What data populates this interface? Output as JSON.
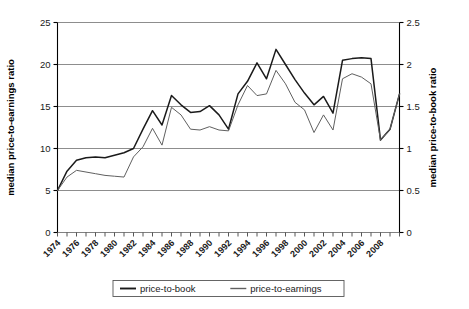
{
  "chart_data": {
    "type": "line",
    "title": "",
    "xlabel": "",
    "ylabel": "median price-to-earnings ratio",
    "y2label": "median price-to-book ratio",
    "grid": true,
    "legend_position": "bottom",
    "xlim": [
      1974,
      2010
    ],
    "ylim": [
      0,
      25
    ],
    "y2lim": [
      0,
      2.5
    ],
    "yticks": [
      "0",
      "5",
      "10",
      "15",
      "20",
      "25"
    ],
    "ytick_values": [
      0,
      5,
      10,
      15,
      20,
      25
    ],
    "y2ticks": [
      "0",
      "0.5",
      "1",
      "1.5",
      "2",
      "2.5"
    ],
    "y2tick_values": [
      0,
      0.5,
      1,
      1.5,
      2,
      2.5
    ],
    "x": [
      1974,
      1975,
      1976,
      1977,
      1978,
      1979,
      1980,
      1981,
      1982,
      1983,
      1984,
      1985,
      1986,
      1987,
      1988,
      1989,
      1990,
      1991,
      1992,
      1993,
      1994,
      1995,
      1996,
      1997,
      1998,
      1999,
      2000,
      2001,
      2002,
      2003,
      2004,
      2005,
      2006,
      2007,
      2008,
      2009,
      2010
    ],
    "xticklabels": [
      "1974",
      "1976",
      "1978",
      "1980",
      "1982",
      "1984",
      "1986",
      "1988",
      "1990",
      "1992",
      "1994",
      "1996",
      "1998",
      "2000",
      "2002",
      "2004",
      "2006",
      "2008"
    ],
    "xticklabel_values": [
      1974,
      1976,
      1978,
      1980,
      1982,
      1984,
      1986,
      1988,
      1990,
      1992,
      1994,
      1996,
      1998,
      2000,
      2002,
      2004,
      2006,
      2008
    ],
    "series": [
      {
        "name": "price-to-book",
        "axis": "right",
        "color": "#1a1a1a",
        "width": 1.5,
        "values_left_scale": [
          5.0,
          7.3,
          8.6,
          8.9,
          9.0,
          8.9,
          9.2,
          9.5,
          10.0,
          12.3,
          14.5,
          12.8,
          16.3,
          15.2,
          14.3,
          14.4,
          15.1,
          14.0,
          12.3,
          16.5,
          18.0,
          20.2,
          18.3,
          21.8,
          20.0,
          18.2,
          16.6,
          15.2,
          16.2,
          14.2,
          20.5,
          20.7,
          20.8,
          20.7,
          11.0,
          12.3,
          16.5
        ],
        "values": [
          0.5,
          0.73,
          0.86,
          0.89,
          0.9,
          0.89,
          0.92,
          0.95,
          1.0,
          1.23,
          1.45,
          1.28,
          1.63,
          1.52,
          1.43,
          1.44,
          1.51,
          1.4,
          1.23,
          1.65,
          1.8,
          2.02,
          1.83,
          2.18,
          2.0,
          1.82,
          1.66,
          1.52,
          1.62,
          1.42,
          2.05,
          2.07,
          2.08,
          2.07,
          1.1,
          1.23,
          1.65
        ]
      },
      {
        "name": "price-to-earnings",
        "axis": "left",
        "color": "#606060",
        "width": 1.0,
        "values": [
          5.0,
          6.6,
          7.4,
          7.2,
          7.0,
          6.8,
          6.7,
          6.6,
          9.0,
          10.2,
          12.4,
          10.4,
          14.9,
          14.0,
          12.3,
          12.2,
          12.6,
          12.2,
          12.1,
          15.2,
          17.5,
          16.3,
          16.5,
          19.3,
          17.7,
          15.5,
          14.6,
          11.9,
          14.0,
          12.2,
          18.3,
          18.9,
          18.5,
          17.7,
          11.0,
          12.3,
          16.5
        ]
      }
    ],
    "legend": [
      {
        "label": "price-to-book",
        "color": "#1a1a1a",
        "width": 1.5
      },
      {
        "label": "price-to-earnings",
        "color": "#606060",
        "width": 1.0
      }
    ],
    "colors": {
      "price_to_book": "#1a1a1a",
      "price_to_earnings": "#606060",
      "grid": "#808080",
      "axis": "#000000",
      "background": "#ffffff"
    }
  }
}
